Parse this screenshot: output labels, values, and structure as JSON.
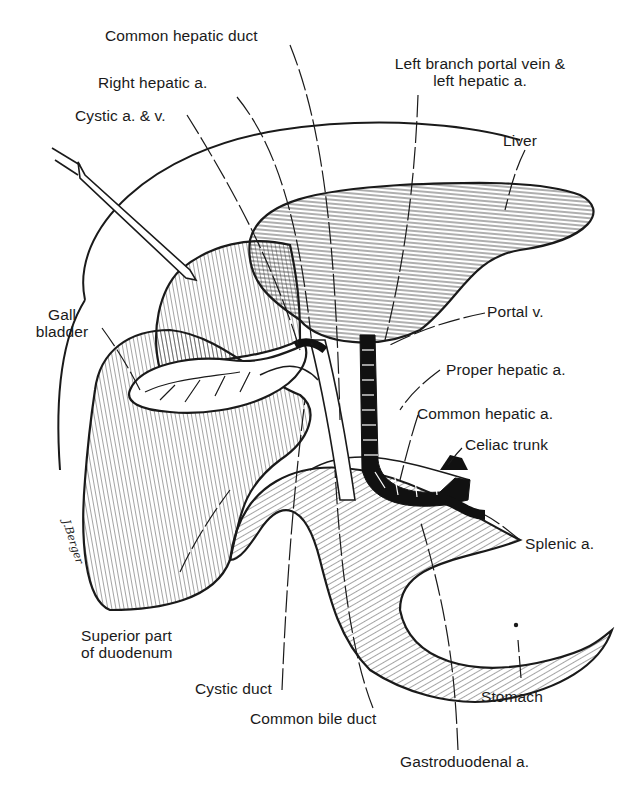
{
  "figure": {
    "signature": "J.Berger",
    "colors": {
      "ink": "#1a1a1a",
      "background": "#ffffff",
      "vessel_fill": "#111111"
    }
  },
  "labels": {
    "common_hepatic_duct": "Common hepatic duct",
    "right_hepatic_a": "Right hepatic a.",
    "cystic_a_v": "Cystic a. & v.",
    "left_branch_line1": "Left branch portal vein &",
    "left_branch_line2": "left hepatic a.",
    "liver": "Liver",
    "gall_line1": "Gall",
    "gall_line2": "bladder",
    "portal_v": "Portal v.",
    "proper_hepatic_a": "Proper hepatic a.",
    "common_hepatic_a": "Common hepatic a.",
    "celiac_trunk": "Celiac trunk",
    "splenic_a": "Splenic a.",
    "superior_line1": "Superior part",
    "superior_line2": "of duodenum",
    "cystic_duct": "Cystic duct",
    "common_bile_duct": "Common bile duct",
    "stomach": "Stomach",
    "gastroduodenal_a": "Gastroduodenal a."
  }
}
